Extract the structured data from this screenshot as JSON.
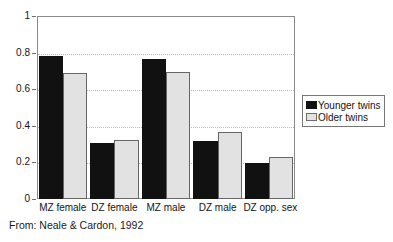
{
  "chart_data": {
    "type": "bar",
    "title": "",
    "subtitle": "",
    "xlabel": "",
    "ylabel": "",
    "ylim": [
      0,
      1
    ],
    "ytick_values": [
      0,
      0.2,
      0.4,
      0.6,
      0.8,
      1
    ],
    "ytick_labels": [
      "0",
      "0.2",
      "0.4",
      "0.6",
      "0.8",
      "1"
    ],
    "grid": "horizontal-dotted",
    "gridline_values": [
      0.2,
      0.4,
      0.6,
      0.8
    ],
    "legend_position": "right-outside",
    "categories": [
      "MZ female",
      "DZ female",
      "MZ male",
      "DZ male",
      "DZ opp. sex"
    ],
    "series": [
      {
        "name": "Younger twins",
        "color": "#111111",
        "values": [
          0.78,
          0.305,
          0.765,
          0.315,
          0.197
        ]
      },
      {
        "name": "Older twins",
        "color": "#e2e2e2",
        "values": [
          0.69,
          0.32,
          0.695,
          0.365,
          0.228
        ]
      }
    ],
    "annotations": [
      "From: Neale & Cardon, 1992"
    ]
  },
  "legend": {
    "items": [
      {
        "label": "Younger twins",
        "swatch": "younger-swatch"
      },
      {
        "label": "Older twins",
        "swatch": "older-swatch"
      }
    ]
  },
  "caption": {
    "source": "From: Neale & Cardon, 1992"
  }
}
